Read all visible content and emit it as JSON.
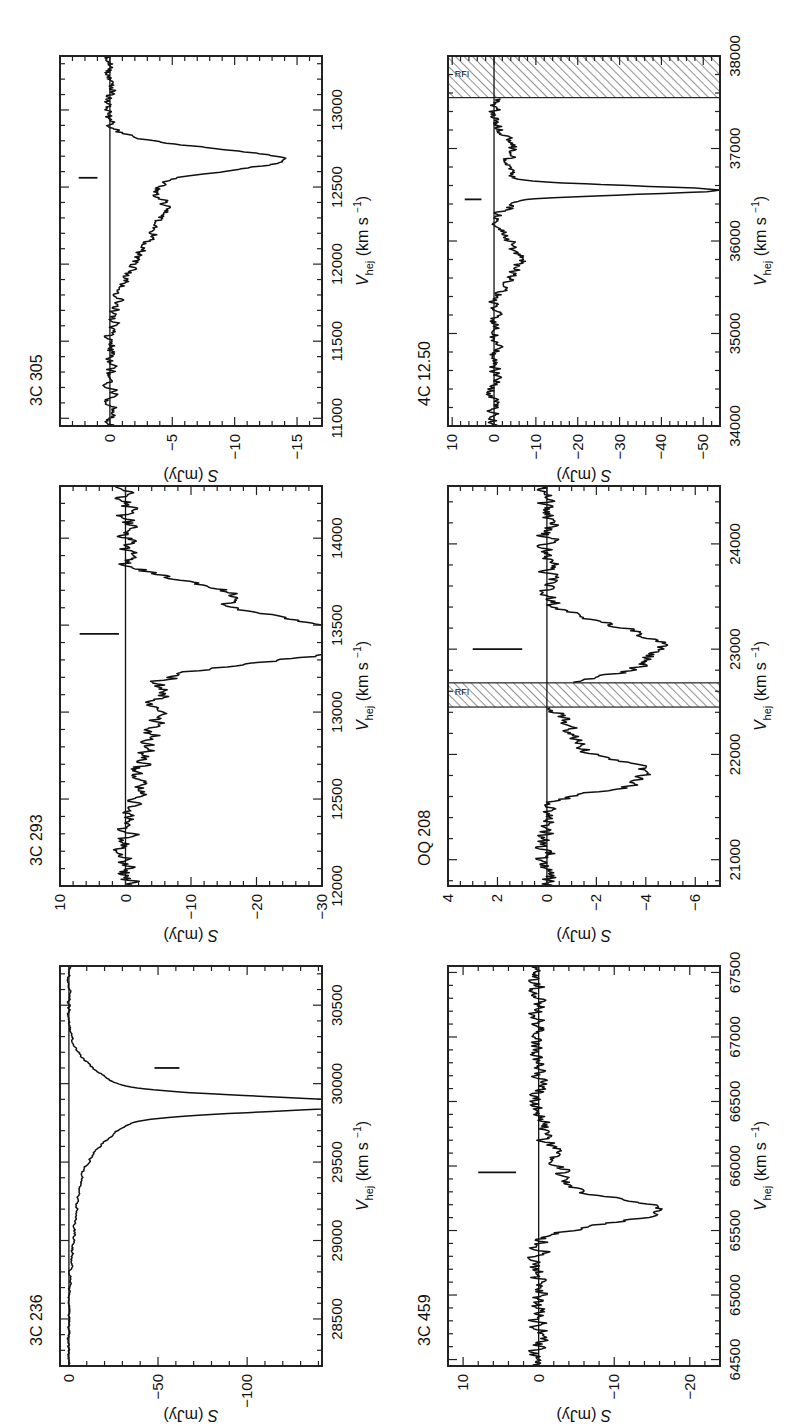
{
  "figure": {
    "xlabel": "V",
    "xlabel_sub": "hej",
    "xlabel_units": "(km s",
    "xlabel_exp": "−1",
    "xlabel_close": ")",
    "ylabel": "S",
    "ylabel_units": "(mJy)",
    "rfi_label": "RFI",
    "line_color": "#111111",
    "frame_color": "#222222"
  },
  "chart_data": [
    {
      "type": "line",
      "title": "3C 236",
      "xlabel": "V_hel (km s^-1)",
      "ylabel": "S (mJy)",
      "xlim": [
        28200,
        30750
      ],
      "ylim": [
        -142,
        5
      ],
      "xticks": [
        28500,
        29000,
        29500,
        30000,
        30500
      ],
      "xminor": 100,
      "yticks": [
        0,
        -50,
        -100
      ],
      "yminor": 10,
      "marker": {
        "x": 30100,
        "y": [
          -48,
          -62
        ]
      },
      "noise": 0.6,
      "features": [
        {
          "center": 29870,
          "width": 45,
          "depth": -135
        },
        {
          "center": 29870,
          "width": 170,
          "depth": -30
        },
        {
          "center": 29700,
          "width": 220,
          "depth": -8
        },
        {
          "center": 29250,
          "width": 260,
          "depth": -4
        }
      ],
      "rfi": []
    },
    {
      "type": "line",
      "title": "3C 293",
      "xlabel": "V_hel (km s^-1)",
      "ylabel": "S (mJy)",
      "xlim": [
        12000,
        14300
      ],
      "ylim": [
        -30,
        10
      ],
      "xticks": [
        12000,
        12500,
        13000,
        13500,
        14000
      ],
      "xminor": 100,
      "yticks": [
        10,
        0,
        -10,
        -20,
        -30
      ],
      "yminor": 2,
      "marker": {
        "x": 13450,
        "y": [
          7,
          1
        ]
      },
      "noise": 1.2,
      "features": [
        {
          "center": 13420,
          "width": 70,
          "depth": -30,
          "flat": 120
        },
        {
          "center": 13680,
          "width": 70,
          "depth": -16
        },
        {
          "center": 13150,
          "width": 260,
          "depth": -4
        },
        {
          "center": 12800,
          "width": 250,
          "depth": -2
        }
      ],
      "rfi": []
    },
    {
      "type": "line",
      "title": "3C 305",
      "xlabel": "V_hel (km s^-1)",
      "ylabel": "S (mJy)",
      "xlim": [
        10950,
        13350
      ],
      "ylim": [
        -17,
        4
      ],
      "xticks": [
        11000,
        11500,
        12000,
        12500,
        13000
      ],
      "xminor": 100,
      "yticks": [
        0,
        -5,
        -10,
        -15
      ],
      "yminor": 1,
      "marker": {
        "x": 12560,
        "y": [
          2.5,
          1
        ]
      },
      "noise": 0.35,
      "features": [
        {
          "center": 12680,
          "width": 70,
          "depth": -12.5
        },
        {
          "center": 12400,
          "width": 200,
          "depth": -3.5
        },
        {
          "center": 12100,
          "width": 250,
          "depth": -1.5
        }
      ],
      "rfi": []
    },
    {
      "type": "line",
      "title": "3C 459",
      "xlabel": "V_hel (km s^-1)",
      "ylabel": "S (mJy)",
      "xlim": [
        64450,
        67550
      ],
      "ylim": [
        -24,
        12
      ],
      "xticks": [
        64500,
        65000,
        65500,
        66000,
        66500,
        67000,
        67500
      ],
      "xminor": 100,
      "yticks": [
        10,
        0,
        -10,
        -20
      ],
      "yminor": 2,
      "marker": {
        "x": 65950,
        "y": [
          8,
          3
        ]
      },
      "noise": 0.9,
      "features": [
        {
          "center": 65650,
          "width": 90,
          "depth": -15
        },
        {
          "center": 65950,
          "width": 180,
          "depth": -3
        }
      ],
      "rfi": []
    },
    {
      "type": "line",
      "title": "OQ 208",
      "xlabel": "V_hel (km s^-1)",
      "ylabel": "S (mJy)",
      "xlim": [
        20750,
        24550
      ],
      "ylim": [
        -7,
        4
      ],
      "xticks": [
        21000,
        22000,
        23000,
        24000
      ],
      "xminor": 200,
      "yticks": [
        4,
        2,
        0,
        -2,
        -4,
        -6
      ],
      "yminor": 0.5,
      "marker": {
        "x": 23000,
        "y": [
          3,
          1
        ]
      },
      "noise": 0.3,
      "features": [
        {
          "center": 23050,
          "width": 170,
          "depth": -4.5
        },
        {
          "center": 22800,
          "width": 90,
          "depth": -1.8
        },
        {
          "center": 21850,
          "width": 100,
          "depth": -3.3
        },
        {
          "center": 21700,
          "width": 80,
          "depth": -2
        },
        {
          "center": 22150,
          "width": 180,
          "depth": -1.2
        }
      ],
      "rfi": [
        {
          "from": 22450,
          "to": 22680
        }
      ]
    },
    {
      "type": "line",
      "title": "4C 12.50",
      "xlabel": "V_hel (km s^-1)",
      "ylabel": "S (mJy)",
      "xlim": [
        34000,
        38000
      ],
      "ylim": [
        -54,
        11
      ],
      "xticks": [
        34000,
        35000,
        36000,
        37000,
        38000
      ],
      "xminor": 200,
      "yticks": [
        10,
        0,
        -10,
        -20,
        -30,
        -40,
        -50
      ],
      "yminor": 2,
      "marker": {
        "x": 36450,
        "y": [
          7,
          3
        ]
      },
      "noise": 1.2,
      "features": [
        {
          "center": 36550,
          "width": 45,
          "depth": -45
        },
        {
          "center": 36550,
          "width": 140,
          "depth": -8
        },
        {
          "center": 35800,
          "width": 200,
          "depth": -6
        },
        {
          "center": 37000,
          "width": 140,
          "depth": -5
        }
      ],
      "rfi": [
        {
          "from": 37550,
          "to": 38000
        }
      ]
    }
  ]
}
